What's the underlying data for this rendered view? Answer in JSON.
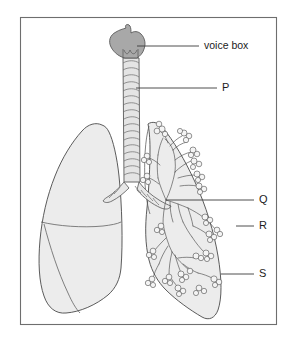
{
  "figure": {
    "frame": {
      "x": 20,
      "y": 17,
      "width": 257,
      "height": 308,
      "stroke_color": "#6e6e6e"
    },
    "background_color": "#ffffff"
  },
  "colors": {
    "lung_fill": "#ececec",
    "larynx_fill": "#a8a8a8",
    "outline_stroke": "#4a4a4a",
    "leader_stroke": "#3a3a3a",
    "label_text": "#1c1c1c",
    "alveoli_fill": "#f4f4f4"
  },
  "labels": [
    {
      "id": "voice-box",
      "text": "voice box",
      "text_x": 204,
      "text_y": 46,
      "leader": {
        "x1": 137,
        "y1": 46,
        "x2": 199,
        "y2": 46
      },
      "points_to": "larynx"
    },
    {
      "id": "P",
      "text": "P",
      "text_x": 222,
      "text_y": 88,
      "leader": {
        "x1": 136,
        "y1": 88,
        "x2": 217,
        "y2": 88
      },
      "points_to": "trachea"
    },
    {
      "id": "Q",
      "text": "Q",
      "text_x": 259,
      "text_y": 200,
      "leader": {
        "x1": 166,
        "y1": 200,
        "x2": 254,
        "y2": 200
      },
      "points_to": "bronchiole"
    },
    {
      "id": "R",
      "text": "R",
      "text_x": 259,
      "text_y": 226,
      "leader": {
        "x1": 236,
        "y1": 226,
        "x2": 254,
        "y2": 226
      },
      "points_to": "lung-surface"
    },
    {
      "id": "S",
      "text": "S",
      "text_x": 259,
      "text_y": 274,
      "leader": {
        "x1": 221,
        "y1": 274,
        "x2": 254,
        "y2": 274
      },
      "points_to": "alveoli"
    }
  ],
  "structures": [
    {
      "id": "larynx",
      "name": "voice box (larynx)",
      "fill": "#a8a8a8"
    },
    {
      "id": "trachea",
      "name": "trachea with cartilage rings",
      "fill": "#e4e4e4"
    },
    {
      "id": "left-lung",
      "name": "left lung (viewer left, shaded, lobed)",
      "fill": "#ececec"
    },
    {
      "id": "right-lung",
      "name": "right lung (viewer right, cut-away showing bronchial tree)",
      "fill": "#ececec"
    },
    {
      "id": "bronchial-tree",
      "name": "bronchial tree with alveolar clusters",
      "fill": "#f4f4f4"
    }
  ]
}
